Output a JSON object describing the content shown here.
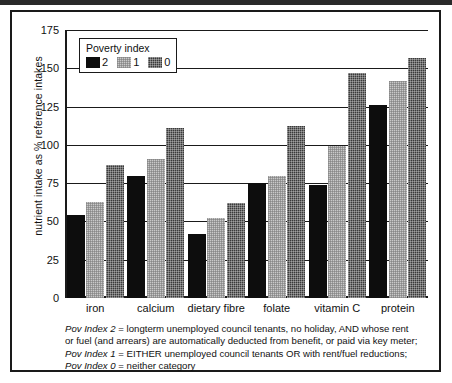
{
  "chart_data": {
    "type": "bar",
    "title": "",
    "xlabel": "",
    "ylabel": "nutrient intake as % reference intakes",
    "ylim": [
      0,
      175
    ],
    "yticks": [
      0,
      25,
      50,
      75,
      100,
      125,
      150,
      175
    ],
    "grid": true,
    "legend_position": "top-left-inside",
    "legend_title": "Poverty index",
    "categories": [
      "iron",
      "calcium",
      "dietary fibre",
      "folate",
      "vitamin C",
      "protein"
    ],
    "series": [
      {
        "name": "2",
        "values": [
          54,
          80,
          42,
          75,
          74,
          126
        ]
      },
      {
        "name": "1",
        "values": [
          63,
          91,
          52,
          80,
          99,
          142
        ]
      },
      {
        "name": "0",
        "values": [
          87,
          111,
          62,
          112,
          147,
          157
        ]
      }
    ],
    "colors": {
      "series_2": "#0d0d0d",
      "series_1": "#c9c9c9",
      "series_0": "#3a3a3a",
      "axis": "#1a1a1a",
      "background": "#ffffff"
    }
  },
  "legend": {
    "title": "Poverty index",
    "entries": [
      {
        "label": "2",
        "swatch": "solid-black-swatch"
      },
      {
        "label": "1",
        "swatch": "light-grey-checker-swatch"
      },
      {
        "label": "0",
        "swatch": "dark-grey-checker-swatch"
      }
    ]
  },
  "footnote": {
    "line1_key": "Pov Index 2",
    "line1_text": " = longterm unemployed council tenants, no holiday, AND whose rent",
    "line2_text": "or fuel (and arrears) are automatically deducted from benefit, or paid via key meter;",
    "line3_key": "Pov Index 1",
    "line3_text": " = EITHER unemployed council tenants OR with rent/fuel reductions;",
    "line4_key": "Pov Index 0",
    "line4_text": " = neither category"
  }
}
